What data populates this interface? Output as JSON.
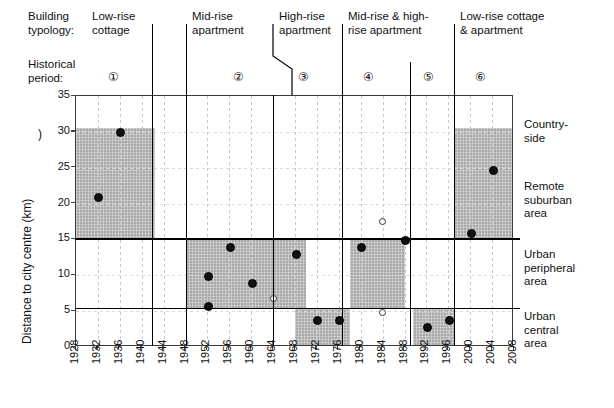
{
  "header": {
    "typology_label": "Building\ntypology:",
    "period_label": "Historical\nperiod:",
    "typologies": [
      {
        "name": "low-rise-cottage",
        "label": "Low-rise\ncottage"
      },
      {
        "name": "mid-rise-apartment",
        "label": "Mid-rise\napartment"
      },
      {
        "name": "high-rise-apartment",
        "label": "High-rise\napartment"
      },
      {
        "name": "mid-and-high-rise-apartment",
        "label": "Mid-rise & high-\nrise apartment"
      },
      {
        "name": "low-rise-cottage-and-apartment",
        "label": "Low-rise cottage\n& apartment"
      }
    ],
    "periods": [
      "①",
      "②",
      "③",
      "④",
      "⑤",
      "⑥"
    ]
  },
  "zones": [
    {
      "name": "countryside",
      "label": "Country-\nside"
    },
    {
      "name": "remote-suburban-area",
      "label": "Remote\nsuburban\narea"
    },
    {
      "name": "urban-peripheral-area",
      "label": "Urban\nperipheral\narea"
    },
    {
      "name": "urban-central-area",
      "label": "Urban\ncentral\narea"
    }
  ],
  "stray_mark": ")",
  "chart_data": {
    "type": "scatter",
    "title": "",
    "xlabel": "",
    "ylabel": "Distance to city centre (km)",
    "xlim": [
      1928,
      2008
    ],
    "ylim": [
      0,
      35
    ],
    "grid": true,
    "legend": "",
    "xticks": [
      1928,
      1932,
      1936,
      1940,
      1944,
      1948,
      1952,
      1956,
      1960,
      1964,
      1968,
      1972,
      1976,
      1980,
      1984,
      1988,
      1992,
      1996,
      2000,
      2004,
      2008
    ],
    "yticks": [
      0,
      5,
      10,
      15,
      20,
      25,
      30,
      35
    ],
    "zone_boundaries_km": [
      5.3,
      15,
      30.5
    ],
    "series": [
      {
        "name": "Filled markers (built projects)",
        "marker": "filled-circle",
        "points": [
          {
            "x": 1932,
            "y": 21
          },
          {
            "x": 1936,
            "y": 30
          },
          {
            "x": 1952,
            "y": 10
          },
          {
            "x": 1952,
            "y": 5.8
          },
          {
            "x": 1956,
            "y": 14
          },
          {
            "x": 1960,
            "y": 9
          },
          {
            "x": 1968,
            "y": 13
          },
          {
            "x": 1972,
            "y": 3.8
          },
          {
            "x": 1976,
            "y": 3.8
          },
          {
            "x": 1980,
            "y": 14
          },
          {
            "x": 1988,
            "y": 15
          },
          {
            "x": 1992,
            "y": 2.9
          },
          {
            "x": 1996,
            "y": 3.8
          },
          {
            "x": 2000,
            "y": 16
          },
          {
            "x": 2004,
            "y": 24.8
          }
        ]
      },
      {
        "name": "Open markers",
        "marker": "open-circle",
        "points": [
          {
            "x": 1964,
            "y": 6.8
          },
          {
            "x": 1984,
            "y": 17.5
          },
          {
            "x": 1984,
            "y": 4.8
          }
        ]
      }
    ],
    "shaded_periods": [
      {
        "period": "①",
        "x_start": 1928,
        "x_end": 1942.5,
        "y_low": 15,
        "y_high": 30.5
      },
      {
        "period": "②",
        "x_start": 1948,
        "x_end": 1970,
        "y_low": 5.3,
        "y_high": 15
      },
      {
        "period": "③",
        "x_start": 1968,
        "x_end": 1978,
        "y_low": 0,
        "y_high": 5.3
      },
      {
        "period": "④",
        "x_start": 1978,
        "x_end": 1988,
        "y_low": 5.3,
        "y_high": 15
      },
      {
        "period": "⑤",
        "x_start": 1989.5,
        "x_end": 1997,
        "y_low": 0,
        "y_high": 5.3
      },
      {
        "period": "⑥",
        "x_start": 1997,
        "x_end": 2008,
        "y_low": 15,
        "y_high": 30.5
      }
    ]
  }
}
